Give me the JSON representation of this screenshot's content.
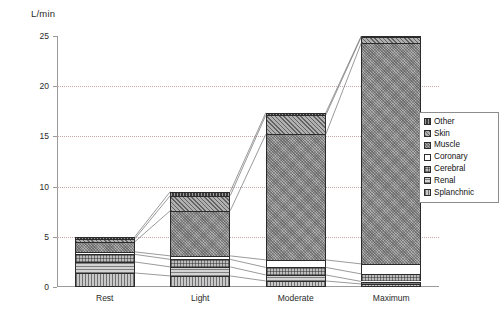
{
  "chart_data": {
    "type": "bar",
    "stacked": true,
    "title": "",
    "subtitle": "",
    "unit_label": "L/min",
    "xlabel": "",
    "ylabel": "L/min",
    "ylim": [
      0,
      25
    ],
    "yticks": [
      0,
      5,
      10,
      15,
      20,
      25
    ],
    "grid": "horizontal-dotted",
    "legend_position": "right",
    "categories": [
      "Rest",
      "Light",
      "Moderate",
      "Maximum"
    ],
    "series": [
      {
        "name": "Splanchnic",
        "key": "splanchnic",
        "values": [
          1.4,
          1.1,
          0.6,
          0.3
        ]
      },
      {
        "name": "Renal",
        "key": "renal",
        "values": [
          1.1,
          0.9,
          0.6,
          0.25
        ]
      },
      {
        "name": "Cerebral",
        "key": "cerebral",
        "values": [
          0.75,
          0.75,
          0.75,
          0.75
        ]
      },
      {
        "name": "Coronary",
        "key": "coronary",
        "values": [
          0.25,
          0.35,
          0.75,
          1.0
        ]
      },
      {
        "name": "Muscle",
        "key": "muscle",
        "values": [
          1.0,
          4.5,
          12.5,
          22.0
        ]
      },
      {
        "name": "Skin",
        "key": "skin",
        "values": [
          0.3,
          1.5,
          1.9,
          0.6
        ]
      },
      {
        "name": "Other",
        "key": "other",
        "values": [
          0.2,
          0.4,
          0.25,
          0.1
        ]
      }
    ],
    "totals": [
      5.0,
      9.5,
      17.35,
      25.0
    ],
    "connectors": true
  },
  "legend": {
    "items": [
      {
        "label": "Other",
        "swatch": "other"
      },
      {
        "label": "Skin",
        "swatch": "skin"
      },
      {
        "label": "Muscle",
        "swatch": "muscle"
      },
      {
        "label": "Coronary",
        "swatch": "coronary"
      },
      {
        "label": "Cerebral",
        "swatch": "cerebral"
      },
      {
        "label": "Renal",
        "swatch": "renal"
      },
      {
        "label": "Splanchnic",
        "swatch": "splanchnic"
      }
    ]
  }
}
